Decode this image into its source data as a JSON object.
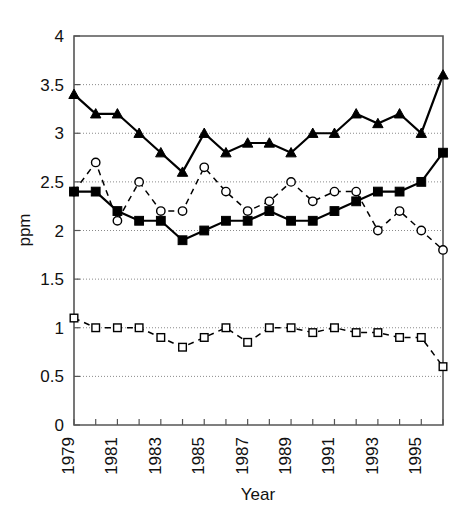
{
  "chart_data": {
    "type": "line",
    "title": "",
    "xlabel": "Year",
    "ylabel": "ppm",
    "xlim": [
      1979,
      1996
    ],
    "ylim": [
      0,
      4
    ],
    "ytick_labels": [
      "0",
      "0.5",
      "1",
      "1.5",
      "2",
      "2.5",
      "3",
      "3.5",
      "4"
    ],
    "ytick_values": [
      0,
      0.5,
      1,
      1.5,
      2,
      2.5,
      3,
      3.5,
      4
    ],
    "xtick_labels": [
      "1979",
      "1981",
      "1983",
      "1985",
      "1987",
      "1989",
      "1991",
      "1993",
      "1995"
    ],
    "xtick_values": [
      1979,
      1981,
      1983,
      1985,
      1987,
      1989,
      1991,
      1993,
      1995
    ],
    "x": [
      1979,
      1980,
      1981,
      1982,
      1983,
      1984,
      1985,
      1986,
      1987,
      1988,
      1989,
      1990,
      1991,
      1992,
      1993,
      1994,
      1995,
      1996
    ],
    "grid": true,
    "grid_axis": "y",
    "legend": "none",
    "series": [
      {
        "name": "filled-triangle-series",
        "marker": "triangle-filled",
        "line_style": "solid",
        "color": "#000000",
        "values": [
          3.4,
          3.2,
          3.2,
          3.0,
          2.8,
          2.6,
          3.0,
          2.8,
          2.9,
          2.9,
          2.8,
          3.0,
          3.0,
          3.2,
          3.1,
          3.2,
          3.0,
          3.6
        ]
      },
      {
        "name": "open-circle-series",
        "marker": "circle-open",
        "line_style": "dashed",
        "color": "#000000",
        "values": [
          2.4,
          2.7,
          2.1,
          2.5,
          2.2,
          2.2,
          2.65,
          2.4,
          2.2,
          2.3,
          2.5,
          2.3,
          2.4,
          2.4,
          2.0,
          2.2,
          2.0,
          1.8
        ]
      },
      {
        "name": "filled-square-series",
        "marker": "square-filled",
        "line_style": "solid",
        "color": "#000000",
        "values": [
          2.4,
          2.4,
          2.2,
          2.1,
          2.1,
          1.9,
          2.0,
          2.1,
          2.1,
          2.2,
          2.1,
          2.1,
          2.2,
          2.3,
          2.4,
          2.4,
          2.5,
          2.8
        ]
      },
      {
        "name": "open-square-series",
        "marker": "square-open",
        "line_style": "dashed",
        "color": "#000000",
        "values": [
          1.1,
          1.0,
          1.0,
          1.0,
          0.9,
          0.8,
          0.9,
          1.0,
          0.85,
          1.0,
          1.0,
          0.95,
          1.0,
          0.95,
          0.95,
          0.9,
          0.9,
          0.6
        ]
      }
    ]
  }
}
